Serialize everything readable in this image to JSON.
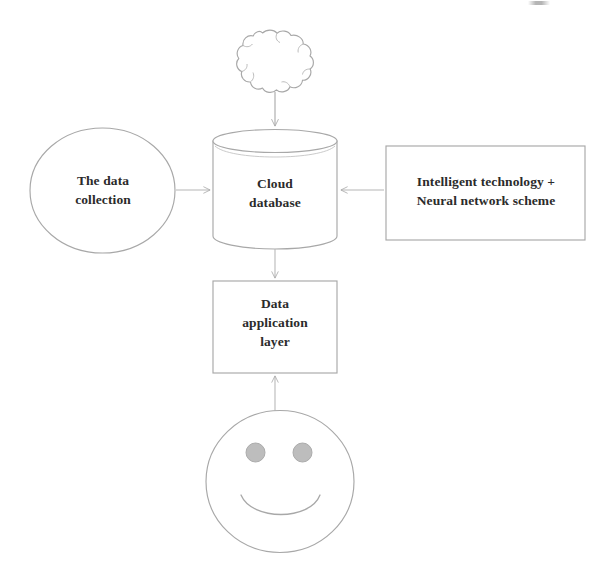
{
  "diagram": {
    "background_color": "#ffffff",
    "stroke_color": "#a8a8a8",
    "text_color": "#2b2b2b",
    "eye_fill_color": "#b9b9b9",
    "nodes": {
      "cloud": {
        "shape": "cloud",
        "label": "",
        "icon": "cloud-icon"
      },
      "data_collection": {
        "shape": "ellipse",
        "label": "The data\ncollection"
      },
      "cloud_database": {
        "shape": "cylinder",
        "label": "Cloud\ndatabase"
      },
      "intelligent_technology": {
        "shape": "rectangle",
        "label": "Intelligent technology +\nNeural network scheme"
      },
      "data_application_layer": {
        "shape": "rectangle",
        "label": "Data\napplication\nlayer"
      },
      "user": {
        "shape": "smiley-face",
        "label": "",
        "icon": "smiley-face-icon"
      }
    },
    "edges": [
      {
        "id": "cloud-to-database",
        "from": "cloud",
        "to": "cloud_database",
        "direction": "down"
      },
      {
        "id": "collection-to-database",
        "from": "data_collection",
        "to": "cloud_database",
        "direction": "right"
      },
      {
        "id": "technology-to-database",
        "from": "intelligent_technology",
        "to": "cloud_database",
        "direction": "left"
      },
      {
        "id": "database-to-application",
        "from": "cloud_database",
        "to": "data_application_layer",
        "direction": "down"
      },
      {
        "id": "user-to-application",
        "from": "user",
        "to": "data_application_layer",
        "direction": "up"
      }
    ]
  }
}
